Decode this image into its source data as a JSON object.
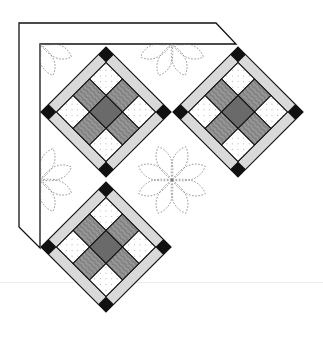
{
  "diagram": {
    "colors": {
      "background": "#ffffff",
      "outline": "#111111",
      "border_fill": "#ffffff",
      "sashing": "#d9d9d9",
      "cornerstone": "#111111",
      "center_patch": "#6a6a6a",
      "textured_patch": "#8c8c8c",
      "light_patch": "#ffffff",
      "quilting_line": "#777777",
      "separator": "#ececec"
    },
    "border": {
      "outer": [
        [
          19,
          23
        ],
        [
          216,
          23
        ],
        [
          236,
          44
        ],
        [
          40,
          44
        ],
        [
          40,
          248
        ],
        [
          19,
          227
        ]
      ],
      "inner_corner": [
        40,
        44
      ]
    },
    "blocks": [
      {
        "id": "block-top-left",
        "center": [
          106,
          112
        ],
        "half_diagonal": 65
      },
      {
        "id": "block-top-right",
        "center": [
          238,
          112
        ],
        "half_diagonal": 65
      },
      {
        "id": "block-bottom-left",
        "center": [
          106,
          247
        ],
        "half_diagonal": 65
      }
    ],
    "nine_patch_pattern": [
      [
        "light",
        "textured",
        "light"
      ],
      [
        "textured",
        "center",
        "textured"
      ],
      [
        "light",
        "textured",
        "light"
      ]
    ],
    "quilting_motifs": [
      {
        "id": "flower-corner",
        "center": [
          40,
          44
        ],
        "radius": 34,
        "clip": "quarter"
      },
      {
        "id": "flower-top",
        "center": [
          172,
          44
        ],
        "radius": 34,
        "clip": "lower-half"
      },
      {
        "id": "flower-left",
        "center": [
          40,
          180
        ],
        "radius": 34,
        "clip": "right-half"
      },
      {
        "id": "flower-center",
        "center": [
          172,
          180
        ],
        "radius": 36,
        "clip": "none"
      }
    ],
    "petal_count": 8
  }
}
